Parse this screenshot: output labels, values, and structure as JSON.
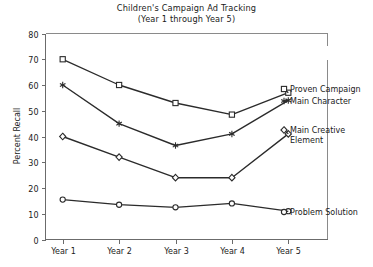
{
  "chart_data": {
    "type": "line",
    "title": "Children's Campaign Ad Tracking",
    "subtitle": "(Year 1 through Year 5)",
    "xlabel": "",
    "ylabel": "Percent Recall",
    "categories": [
      "Year 1",
      "Year 2",
      "Year 3",
      "Year 4",
      "Year 5"
    ],
    "ylim": [
      0,
      80
    ],
    "yticks": [
      0,
      10,
      20,
      30,
      40,
      50,
      60,
      70,
      80
    ],
    "grid": false,
    "legend_position": "right-inline-labels",
    "series": [
      {
        "name": "Proven Campaign",
        "marker": "square-open",
        "values": [
          70,
          60,
          53,
          48.5,
          57
        ]
      },
      {
        "name": "Main Character",
        "marker": "asterisk",
        "values": [
          60,
          45,
          36.5,
          41,
          54
        ]
      },
      {
        "name": "Main Creative Element",
        "marker": "diamond-open",
        "values": [
          40,
          32,
          24,
          24,
          41
        ]
      },
      {
        "name": "Problem Solution",
        "marker": "circle-open",
        "values": [
          15.5,
          13.5,
          12.5,
          14,
          11
        ]
      }
    ]
  },
  "legend_labels": {
    "proven_campaign": "Proven Campaign",
    "main_character": "Main Character",
    "main_creative_element_line1": "Main Creative",
    "main_creative_element_line2": "Element",
    "problem_solution": "Problem Solution"
  },
  "colors": {
    "line": "#2b2b2b",
    "axis": "#6b6b6b",
    "frame": "#8a8a8a",
    "text": "#1a1a1a",
    "background": "#ffffff"
  }
}
